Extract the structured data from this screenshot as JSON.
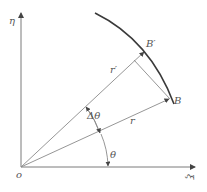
{
  "diagram": {
    "type": "polar-coordinate-geometry",
    "axes": {
      "vertical_label": "η",
      "horizontal_label": "ξ",
      "origin_label": "o"
    },
    "points": {
      "B": "B",
      "B_prime": "B′"
    },
    "segments": {
      "r": "r",
      "r_prime": "r′"
    },
    "angles": {
      "theta": "θ",
      "delta_theta": "Δθ"
    },
    "colors": {
      "line": "#8a8a8a",
      "curve": "#3a3a3a",
      "text": "#555555"
    }
  }
}
